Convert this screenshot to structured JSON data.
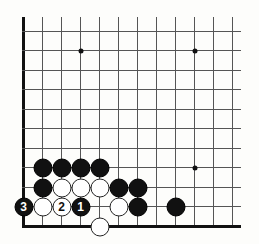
{
  "diagram": {
    "type": "go-board-fragment",
    "grid": {
      "columns_x": [
        23,
        42,
        61,
        80,
        99,
        118,
        137,
        156,
        175,
        194,
        213,
        232
      ],
      "rows_y": [
        31,
        50,
        70,
        89,
        109,
        128,
        148,
        167,
        187,
        206,
        226
      ],
      "line_top_y": 17,
      "line_right_x": 241,
      "left_edge": true,
      "bottom_edge": true
    },
    "colors": {
      "black_stone": "#111111",
      "white_stone": "#ffffff",
      "grid_line": "#555555",
      "background": "#fdfdfb"
    },
    "star_points": [
      {
        "col": 3,
        "row": 1
      },
      {
        "col": 9,
        "row": 1
      },
      {
        "col": 9,
        "row": 7
      }
    ],
    "stones": [
      {
        "color": "black",
        "col": 1,
        "row": 7,
        "label": ""
      },
      {
        "color": "black",
        "col": 2,
        "row": 7,
        "label": ""
      },
      {
        "color": "black",
        "col": 3,
        "row": 7,
        "label": ""
      },
      {
        "color": "black",
        "col": 4,
        "row": 7,
        "label": ""
      },
      {
        "color": "black",
        "col": 1,
        "row": 8,
        "label": ""
      },
      {
        "color": "white",
        "col": 2,
        "row": 8,
        "label": ""
      },
      {
        "color": "white",
        "col": 3,
        "row": 8,
        "label": ""
      },
      {
        "color": "white",
        "col": 4,
        "row": 8,
        "label": ""
      },
      {
        "color": "black",
        "col": 5,
        "row": 8,
        "label": ""
      },
      {
        "color": "black",
        "col": 6,
        "row": 8,
        "label": ""
      },
      {
        "color": "black",
        "col": 0,
        "row": 9,
        "label": "3"
      },
      {
        "color": "white",
        "col": 1,
        "row": 9,
        "label": ""
      },
      {
        "color": "white",
        "col": 2,
        "row": 9,
        "label": "2"
      },
      {
        "color": "black",
        "col": 3,
        "row": 9,
        "label": "1"
      },
      {
        "color": "white",
        "col": 5,
        "row": 9,
        "label": ""
      },
      {
        "color": "black",
        "col": 6,
        "row": 9,
        "label": ""
      },
      {
        "color": "black",
        "col": 8,
        "row": 9,
        "label": ""
      },
      {
        "color": "white",
        "col": 4,
        "row": 10,
        "label": ""
      }
    ]
  }
}
